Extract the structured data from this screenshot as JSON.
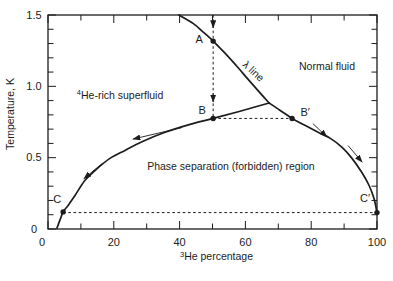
{
  "figure": {
    "background": "#ffffff",
    "ink_color": "#1c1c1c"
  },
  "chart_data": {
    "type": "line",
    "xlabel_sup": "3",
    "xlabel": "He percentage",
    "ylabel": "Temperature, K",
    "xlim": [
      0,
      100
    ],
    "ylim": [
      0,
      1.5
    ],
    "x_major_ticks": [
      0,
      20,
      40,
      60,
      80,
      100
    ],
    "x_minor_tick_step": 10,
    "y_major_tick_labels": [
      "0",
      "0.5",
      "1.0",
      "1.5"
    ],
    "y_minor_tick_step": 0.1,
    "series": [
      {
        "name": "lambda-line",
        "points": [
          [
            39.8,
            1.5
          ],
          [
            44.2,
            1.44
          ],
          [
            46.9,
            1.386
          ],
          [
            50.2,
            1.317
          ],
          [
            53.8,
            1.232
          ],
          [
            57.8,
            1.13
          ],
          [
            62.3,
            1.01
          ],
          [
            67.2,
            0.883
          ]
        ]
      },
      {
        "name": "phase-boundary-left",
        "points": [
          [
            67.2,
            0.883
          ],
          [
            58.4,
            0.826
          ],
          [
            50.2,
            0.775
          ],
          [
            43.2,
            0.733
          ],
          [
            35.6,
            0.678
          ],
          [
            28.9,
            0.615
          ],
          [
            23.4,
            0.551
          ],
          [
            18.8,
            0.495
          ],
          [
            14.3,
            0.41
          ],
          [
            11.2,
            0.34
          ],
          [
            8.2,
            0.235
          ],
          [
            6.1,
            0.165
          ],
          [
            4.6,
            0.12
          ],
          [
            3.6,
            0.06
          ],
          [
            2.7,
            0.005
          ]
        ]
      },
      {
        "name": "phase-boundary-right",
        "points": [
          [
            67.2,
            0.883
          ],
          [
            70.5,
            0.833
          ],
          [
            74.2,
            0.775
          ],
          [
            78.1,
            0.727
          ],
          [
            82.1,
            0.678
          ],
          [
            85.7,
            0.637
          ],
          [
            89.4,
            0.572
          ],
          [
            92.4,
            0.495
          ],
          [
            95.4,
            0.396
          ],
          [
            97.6,
            0.305
          ],
          [
            99.1,
            0.213
          ],
          [
            100.0,
            0.115
          ]
        ]
      }
    ],
    "points": [
      {
        "label": "A",
        "x": 50.2,
        "T": 1.317,
        "label_dx": -14,
        "label_dy": -2
      },
      {
        "label": "B",
        "x": 50.2,
        "T": 0.775,
        "label_dx": -11,
        "label_dy": -8
      },
      {
        "label": "B′",
        "x": 74.2,
        "T": 0.775,
        "label_dx": 13,
        "label_dy": -6
      },
      {
        "label": "C",
        "x": 4.6,
        "T": 0.12,
        "label_dx": -6,
        "label_dy": -13
      },
      {
        "label": "C′",
        "x": 100.0,
        "T": 0.115,
        "label_dx": -12,
        "label_dy": -14
      }
    ],
    "dashed_lines": [
      {
        "name": "quench-path",
        "x1": 50.2,
        "T1": 1.5,
        "x2": 50.2,
        "T2": 0.775
      },
      {
        "name": "tie-line-B-Bprime",
        "x1": 50.2,
        "T1": 0.775,
        "x2": 74.2,
        "T2": 0.775
      },
      {
        "name": "tie-line-C-Cprime",
        "x1": 4.6,
        "T1": 0.115,
        "x2": 100.0,
        "T2": 0.115
      }
    ],
    "quench_arrows": [
      {
        "x": 50.2,
        "T_from": 1.47,
        "T_to": 1.41
      },
      {
        "x": 50.2,
        "T_from": 0.95,
        "T_to": 0.89
      }
    ],
    "flow_arrows": [
      {
        "name": "flow-left-upper",
        "from": [
          40.7,
          0.711
        ],
        "to": [
          25.8,
          0.63
        ]
      },
      {
        "name": "flow-left-lower",
        "from": [
          16.4,
          0.458
        ],
        "to": [
          10.9,
          0.352
        ]
      },
      {
        "name": "flow-right-upper",
        "from": [
          80.5,
          0.739
        ],
        "to": [
          84.8,
          0.645
        ]
      },
      {
        "name": "flow-right-lower",
        "from": [
          91.2,
          0.585
        ],
        "to": [
          95.5,
          0.468
        ]
      }
    ],
    "region_labels": [
      {
        "name": "superfluid-region-label",
        "sup": "4",
        "text": "He-rich superfluid",
        "x": 21.9,
        "T": 0.939,
        "rotate": 0
      },
      {
        "name": "normal-fluid-region-label",
        "sup": "",
        "text": "Normal fluid",
        "x": 84.8,
        "T": 1.142,
        "rotate": 0
      },
      {
        "name": "forbidden-region-label",
        "sup": "",
        "text": "Phase separation (forbidden) region",
        "x": 55.6,
        "T": 0.44,
        "rotate": 0
      },
      {
        "name": "lambda-line-label",
        "sup": "",
        "text": "λ line",
        "x": 61.7,
        "T": 1.113,
        "rotate": 43
      }
    ]
  }
}
